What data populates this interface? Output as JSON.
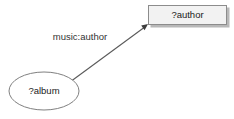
{
  "diagram": {
    "type": "directed-graph",
    "background_color": "#ffffff",
    "width": 234,
    "height": 119,
    "nodes": [
      {
        "id": "author",
        "label": "?author",
        "shape": "rectangle",
        "fill_color": "#f2f2f2",
        "stroke_color": "#8c8c8c",
        "text_color": "#1a1a1a",
        "x": 148,
        "y": 5,
        "width": 79,
        "height": 20,
        "center_x": 187.5,
        "center_y": 15
      },
      {
        "id": "album",
        "label": "?album",
        "shape": "ellipse",
        "fill_color": "#ffffff",
        "stroke_color": "#808080",
        "text_color": "#1a1a1a",
        "center_x": 44,
        "center_y": 91,
        "rx": 35,
        "ry": 19
      }
    ],
    "edges": [
      {
        "id": "edge-album-author",
        "label": "music:author",
        "from": "album",
        "to": "author",
        "stroke_color": "#5a5a5a",
        "arrowhead_color": "#3d3d3d",
        "label_color": "#333333",
        "label_x": 80,
        "label_y": 37,
        "start_x": 70,
        "start_y": 82,
        "end_x": 148,
        "end_y": 24
      }
    ]
  }
}
